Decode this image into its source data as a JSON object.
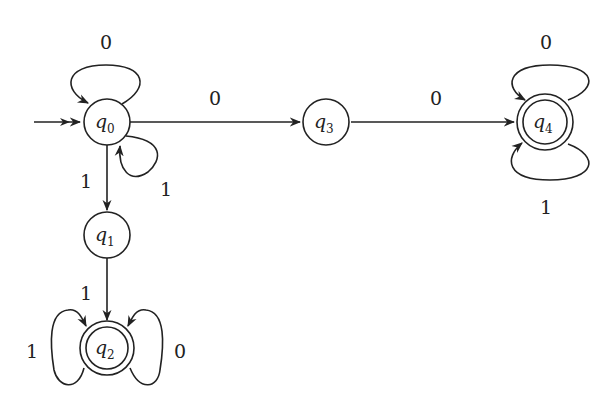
{
  "diagram": {
    "type": "finite-automaton",
    "start_state": "q0",
    "states": [
      {
        "id": "q0",
        "name": "q",
        "sub": "0",
        "accepting": false
      },
      {
        "id": "q1",
        "name": "q",
        "sub": "1",
        "accepting": false
      },
      {
        "id": "q2",
        "name": "q",
        "sub": "2",
        "accepting": true
      },
      {
        "id": "q3",
        "name": "q",
        "sub": "3",
        "accepting": false
      },
      {
        "id": "q4",
        "name": "q",
        "sub": "4",
        "accepting": true
      }
    ],
    "transitions": [
      {
        "from": "q0",
        "to": "q0",
        "label": "0"
      },
      {
        "from": "q0",
        "to": "q0",
        "label": "1"
      },
      {
        "from": "q0",
        "to": "q3",
        "label": "0"
      },
      {
        "from": "q0",
        "to": "q1",
        "label": "1"
      },
      {
        "from": "q1",
        "to": "q2",
        "label": "1"
      },
      {
        "from": "q2",
        "to": "q2",
        "label": "1"
      },
      {
        "from": "q2",
        "to": "q2",
        "label": "0"
      },
      {
        "from": "q3",
        "to": "q4",
        "label": "0"
      },
      {
        "from": "q4",
        "to": "q4",
        "label": "0"
      },
      {
        "from": "q4",
        "to": "q4",
        "label": "1"
      }
    ]
  }
}
